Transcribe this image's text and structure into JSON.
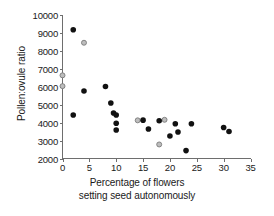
{
  "chart_data": {
    "type": "scatter",
    "title": "",
    "xlabel": "Percentage of flowers setting seed autonomously",
    "xlabel_line1": "Percentage of flowers",
    "xlabel_line2": "setting seed autonomously",
    "ylabel": "Pollen:ovule ratio",
    "xlim": [
      0,
      35
    ],
    "ylim": [
      2000,
      10000
    ],
    "xticks": [
      0,
      5,
      10,
      15,
      20,
      25,
      30,
      35
    ],
    "yticks": [
      2000,
      3000,
      4000,
      5000,
      6000,
      7000,
      8000,
      9000,
      10000
    ],
    "xtick_labels": [
      "0",
      "5",
      "10",
      "15",
      "20",
      "25",
      "30",
      "35"
    ],
    "ytick_labels": [
      "2000",
      "3000",
      "4000",
      "5000",
      "6000",
      "7000",
      "8000",
      "9000",
      "10000"
    ],
    "grid": false,
    "legend": "none",
    "colors": {
      "filled_marker": "#111111",
      "open_marker_fill": "#bdbdbd",
      "open_marker_stroke": "#7a7a7a",
      "axis": "#6e6e6e",
      "text": "#1a1a1a",
      "background": "#ffffff"
    },
    "series": [
      {
        "name": "filled",
        "marker": "filled-circle",
        "points": [
          [
            2,
            9150
          ],
          [
            2,
            4420
          ],
          [
            4,
            5750
          ],
          [
            8,
            6000
          ],
          [
            9,
            5080
          ],
          [
            9.5,
            4530
          ],
          [
            10,
            4420
          ],
          [
            10,
            3960
          ],
          [
            10,
            3580
          ],
          [
            15,
            4130
          ],
          [
            16,
            3640
          ],
          [
            18,
            4100
          ],
          [
            20,
            3250
          ],
          [
            21,
            3930
          ],
          [
            21.5,
            3470
          ],
          [
            23,
            2440
          ],
          [
            24,
            3930
          ],
          [
            30,
            3720
          ],
          [
            31,
            3500
          ]
        ]
      },
      {
        "name": "open",
        "marker": "open-circle",
        "points": [
          [
            0,
            6620
          ],
          [
            0,
            6020
          ],
          [
            4,
            8430
          ],
          [
            14,
            4120
          ],
          [
            18,
            2780
          ],
          [
            19,
            4150
          ]
        ]
      }
    ]
  }
}
